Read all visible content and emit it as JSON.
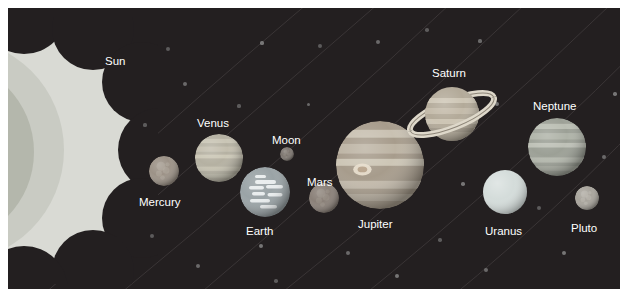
{
  "scene": {
    "title": "Solar System Diagram",
    "background_color": "#231f20",
    "page_background": "#ffffff",
    "label_color": "#ffffff"
  },
  "sun": {
    "name": "Sun",
    "label": "Sun",
    "label_x": 97,
    "label_y": 48,
    "colors": {
      "corona": "#d9dad4",
      "outer": "#c9cbc3",
      "inner": "#b4b7ac"
    },
    "center_x": 16,
    "center_y": 142,
    "radius": 134
  },
  "bodies": [
    {
      "name": "Mercury",
      "label": "Mercury",
      "cx": 156,
      "cy": 163,
      "r": 15,
      "color": "#9c9287",
      "band_color": "#b0a79c",
      "texture": "cratered",
      "label_x": 131,
      "label_y": 189
    },
    {
      "name": "Venus",
      "label": "Venus",
      "cx": 211,
      "cy": 150,
      "r": 24,
      "color": "#b5b1a2",
      "band_color": "#cdc9b8",
      "texture": "banded",
      "label_x": 189,
      "label_y": 110
    },
    {
      "name": "Earth",
      "label": "Earth",
      "cx": 257,
      "cy": 184,
      "r": 25,
      "color": "#9aa3a6",
      "band_color": "#e8eced",
      "texture": "clouds",
      "label_x": 238,
      "label_y": 218
    },
    {
      "name": "Moon",
      "label": "Moon",
      "cx": 279,
      "cy": 146,
      "r": 7,
      "color": "#7d7670",
      "band_color": "#8f8881",
      "texture": "cratered",
      "label_x": 264,
      "label_y": 127
    },
    {
      "name": "Mars",
      "label": "Mars",
      "cx": 316,
      "cy": 190,
      "r": 15,
      "color": "#8a8078",
      "band_color": "#9b9189",
      "texture": "cratered",
      "label_x": 299,
      "label_y": 169
    },
    {
      "name": "Jupiter",
      "label": "Jupiter",
      "cx": 372,
      "cy": 157,
      "r": 44,
      "color": "#a79c8c",
      "band_color": "#cfc8b8",
      "texture": "banded-spot",
      "label_x": 350,
      "label_y": 211
    },
    {
      "name": "Uranus",
      "label": "Uranus",
      "cx": 497,
      "cy": 184,
      "r": 22,
      "color": "#d4dcda",
      "band_color": "#e6ecea",
      "texture": "smooth",
      "label_x": 477,
      "label_y": 218
    },
    {
      "name": "Neptune",
      "label": "Neptune",
      "cx": 549,
      "cy": 139,
      "r": 29,
      "color": "#9ca096",
      "band_color": "#c0c3b8",
      "texture": "banded",
      "label_x": 525,
      "label_y": 93
    },
    {
      "name": "Pluto",
      "label": "Pluto",
      "cx": 579,
      "cy": 190,
      "r": 12,
      "color": "#a8a49c",
      "band_color": "#bcb8b0",
      "texture": "cratered",
      "label_x": 563,
      "label_y": 215
    }
  ],
  "saturn": {
    "name": "Saturn",
    "label": "Saturn",
    "cx": 444,
    "cy": 106,
    "r": 27,
    "color": "#b3aa99",
    "band_color": "#cdc5b4",
    "ring_color": "#ded8ca",
    "ring_tilt_deg": -22,
    "label_x": 424,
    "label_y": 60
  },
  "stars": [
    {
      "x": 160,
      "y": 41,
      "r": 2.0
    },
    {
      "x": 177,
      "y": 76,
      "r": 2.4
    },
    {
      "x": 254,
      "y": 35,
      "r": 1.6
    },
    {
      "x": 312,
      "y": 38,
      "r": 2.2
    },
    {
      "x": 370,
      "y": 34,
      "r": 2.0
    },
    {
      "x": 407,
      "y": 113,
      "r": 2.4
    },
    {
      "x": 419,
      "y": 22,
      "r": 1.8
    },
    {
      "x": 472,
      "y": 33,
      "r": 1.6
    },
    {
      "x": 489,
      "y": 96,
      "r": 2.3
    },
    {
      "x": 531,
      "y": 200,
      "r": 2.0
    },
    {
      "x": 596,
      "y": 149,
      "r": 1.9
    },
    {
      "x": 607,
      "y": 86,
      "r": 1.7
    },
    {
      "x": 144,
      "y": 228,
      "r": 2.4
    },
    {
      "x": 190,
      "y": 258,
      "r": 2.0
    },
    {
      "x": 253,
      "y": 238,
      "r": 2.2
    },
    {
      "x": 268,
      "y": 273,
      "r": 1.8
    },
    {
      "x": 340,
      "y": 245,
      "r": 2.0
    },
    {
      "x": 389,
      "y": 268,
      "r": 2.3
    },
    {
      "x": 432,
      "y": 232,
      "r": 1.7
    },
    {
      "x": 478,
      "y": 262,
      "r": 2.1
    },
    {
      "x": 556,
      "y": 245,
      "r": 2.0
    },
    {
      "x": 231,
      "y": 98,
      "r": 1.6
    },
    {
      "x": 300,
      "y": 96,
      "r": 1.5
    },
    {
      "x": 455,
      "y": 176,
      "r": 1.8
    },
    {
      "x": 137,
      "y": 117,
      "r": 1.6
    }
  ]
}
